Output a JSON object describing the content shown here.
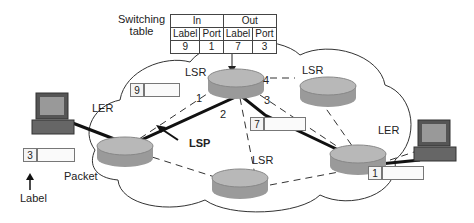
{
  "diagram": {
    "type": "MPLS network",
    "switching_table": {
      "caption_line1": "Switching",
      "caption_line2": "table",
      "group_headers": [
        "In",
        "Out"
      ],
      "column_headers": [
        "Label",
        "Port",
        "Label",
        "Port"
      ],
      "row": [
        "9",
        "1",
        "7",
        "3"
      ]
    },
    "nodes": {
      "ler_left": "LER",
      "ler_right": "LER",
      "lsr_top": "LSR",
      "lsr_right": "LSR",
      "lsr_bottom": "LSR"
    },
    "ports": {
      "p1": "1",
      "p2": "2",
      "p3": "3",
      "p4": "4"
    },
    "packets": {
      "source_label": "3",
      "into_lsr_label": "9",
      "out_of_lsr_label": "7",
      "destination_label": "1"
    },
    "annotations": {
      "label": "Label",
      "packet": "Packet",
      "lsp": "LSP"
    }
  }
}
